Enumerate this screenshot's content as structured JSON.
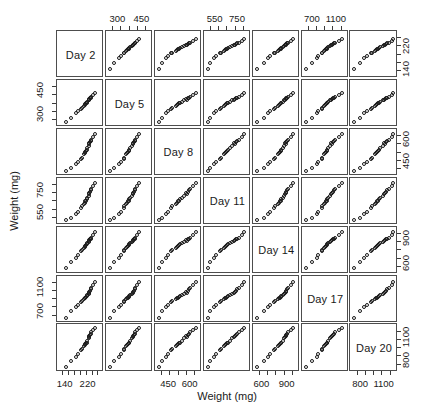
{
  "figure": {
    "type": "scatterplot-matrix",
    "x_axis_title": "Weight (mg)",
    "y_axis_title": "Weight (mg)",
    "variables": [
      "Day 2",
      "Day 5",
      "Day 8",
      "Day 11",
      "Day 14",
      "Day 17",
      "Day 20"
    ],
    "point_symbol": "open-circle",
    "point_color": "#1a1a1a",
    "panel_border_color": "#4d4d4d",
    "background": "#ffffff"
  },
  "axes": {
    "top": [
      {
        "col": 2,
        "labels": [
          "300",
          "450"
        ]
      },
      {
        "col": 4,
        "labels": [
          "550",
          "750"
        ]
      },
      {
        "col": 6,
        "labels": [
          "700",
          "1100"
        ]
      }
    ],
    "bottom": [
      {
        "col": 1,
        "labels": [
          "140",
          "220"
        ]
      },
      {
        "col": 3,
        "labels": [
          "450",
          "600"
        ]
      },
      {
        "col": 5,
        "labels": [
          "600",
          "900"
        ]
      },
      {
        "col": 7,
        "labels": [
          "800",
          "1100"
        ]
      }
    ],
    "left": [
      {
        "row": 2,
        "labels": [
          "450",
          "300"
        ]
      },
      {
        "row": 4,
        "labels": [
          "750",
          "550"
        ]
      },
      {
        "row": 6,
        "labels": [
          "1100",
          "700"
        ]
      }
    ],
    "right": [
      {
        "row": 1,
        "labels": [
          "220",
          "140"
        ]
      },
      {
        "row": 3,
        "labels": [
          "600",
          "450"
        ]
      },
      {
        "row": 5,
        "labels": [
          "900",
          "600"
        ]
      },
      {
        "row": 7,
        "labels": [
          "1100",
          "800"
        ]
      }
    ]
  },
  "chart_data": {
    "type": "scatter",
    "title": "",
    "subtitle": "",
    "xlabel": "Weight (mg)",
    "ylabel": "Weight (mg)",
    "grid": false,
    "legend": "none",
    "matrix": true,
    "variables": [
      "Day 2",
      "Day 5",
      "Day 8",
      "Day 11",
      "Day 14",
      "Day 17",
      "Day 20"
    ],
    "axis_ranges": {
      "Day 2": [
        120,
        265
      ],
      "Day 5": [
        240,
        500
      ],
      "Day 8": [
        370,
        660
      ],
      "Day 11": [
        470,
        840
      ],
      "Day 14": [
        520,
        1010
      ],
      "Day 17": [
        560,
        1250
      ],
      "Day 20": [
        700,
        1230
      ]
    },
    "tick_labels": {
      "Day 2": [
        "140",
        "220"
      ],
      "Day 5": [
        "300",
        "450"
      ],
      "Day 8": [
        "450",
        "600"
      ],
      "Day 11": [
        "550",
        "750"
      ],
      "Day 14": [
        "600",
        "900"
      ],
      "Day 17": [
        "700",
        "1100"
      ],
      "Day 20": [
        "800",
        "1100"
      ]
    },
    "observations": [
      {
        "id": 1,
        "Day 2": 225,
        "Day 5": 395,
        "Day 8": 570,
        "Day 11": 725,
        "Day 14": 880,
        "Day 17": 1020,
        "Day 20": 1110
      },
      {
        "id": 2,
        "Day 2": 228,
        "Day 5": 400,
        "Day 8": 585,
        "Day 11": 735,
        "Day 14": 890,
        "Day 17": 1040,
        "Day 20": 1125
      },
      {
        "id": 3,
        "Day 2": 222,
        "Day 5": 390,
        "Day 8": 560,
        "Day 11": 700,
        "Day 14": 860,
        "Day 17": 990,
        "Day 20": 1085
      },
      {
        "id": 4,
        "Day 2": 218,
        "Day 5": 378,
        "Day 8": 540,
        "Day 11": 680,
        "Day 14": 845,
        "Day 17": 960,
        "Day 20": 1050
      },
      {
        "id": 5,
        "Day 2": 215,
        "Day 5": 372,
        "Day 8": 528,
        "Day 11": 668,
        "Day 14": 830,
        "Day 17": 945,
        "Day 20": 1030
      },
      {
        "id": 6,
        "Day 2": 210,
        "Day 5": 362,
        "Day 8": 512,
        "Day 11": 650,
        "Day 14": 815,
        "Day 17": 925,
        "Day 20": 1010
      },
      {
        "id": 7,
        "Day 2": 232,
        "Day 5": 408,
        "Day 8": 600,
        "Day 11": 760,
        "Day 14": 910,
        "Day 17": 1080,
        "Day 20": 1160
      },
      {
        "id": 8,
        "Day 2": 205,
        "Day 5": 352,
        "Day 8": 498,
        "Day 11": 630,
        "Day 14": 790,
        "Day 17": 900,
        "Day 20": 985
      },
      {
        "id": 9,
        "Day 2": 238,
        "Day 5": 420,
        "Day 8": 620,
        "Day 11": 790,
        "Day 14": 945,
        "Day 17": 1140,
        "Day 20": 1195
      },
      {
        "id": 10,
        "Day 2": 198,
        "Day 5": 340,
        "Day 8": 475,
        "Day 11": 605,
        "Day 14": 760,
        "Day 17": 865,
        "Day 20": 950
      },
      {
        "id": 11,
        "Day 2": 224,
        "Day 5": 392,
        "Day 8": 575,
        "Day 11": 715,
        "Day 14": 870,
        "Day 17": 1005,
        "Day 20": 1095
      },
      {
        "id": 12,
        "Day 2": 212,
        "Day 5": 368,
        "Day 8": 520,
        "Day 11": 658,
        "Day 14": 822,
        "Day 17": 935,
        "Day 20": 1020
      },
      {
        "id": 13,
        "Day 2": 186,
        "Day 5": 318,
        "Day 8": 448,
        "Day 11": 560,
        "Day 14": 700,
        "Day 17": 800,
        "Day 20": 880
      },
      {
        "id": 14,
        "Day 2": 178,
        "Day 5": 305,
        "Day 8": 430,
        "Day 11": 540,
        "Day 14": 672,
        "Day 17": 770,
        "Day 20": 848
      },
      {
        "id": 15,
        "Day 2": 245,
        "Day 5": 432,
        "Day 8": 638,
        "Day 11": 812,
        "Day 14": 972,
        "Day 17": 1185,
        "Day 20": 1215
      },
      {
        "id": 16,
        "Day 2": 160,
        "Day 5": 278,
        "Day 8": 400,
        "Day 11": 505,
        "Day 14": 620,
        "Day 17": 700,
        "Day 20": 790
      },
      {
        "id": 17,
        "Day 2": 208,
        "Day 5": 358,
        "Day 8": 505,
        "Day 11": 640,
        "Day 14": 800,
        "Day 17": 912,
        "Day 20": 998
      },
      {
        "id": 18,
        "Day 2": 196,
        "Day 5": 335,
        "Day 8": 468,
        "Day 11": 595,
        "Day 14": 748,
        "Day 17": 852,
        "Day 20": 938
      },
      {
        "id": 19,
        "Day 2": 142,
        "Day 5": 252,
        "Day 8": 382,
        "Day 11": 482,
        "Day 14": 545,
        "Day 17": 590,
        "Day 20": 718
      },
      {
        "id": 20,
        "Day 2": 230,
        "Day 5": 404,
        "Day 8": 592,
        "Day 11": 748,
        "Day 14": 898,
        "Day 17": 1060,
        "Day 20": 1140
      }
    ]
  }
}
